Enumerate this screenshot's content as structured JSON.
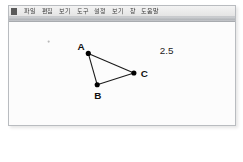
{
  "window": {
    "app_mark_name": "app-icon",
    "menu_items": [
      {
        "label": "파일"
      },
      {
        "label": "편집"
      },
      {
        "label": "보기"
      },
      {
        "label": "도구"
      },
      {
        "label": "설정"
      },
      {
        "label": "보기"
      },
      {
        "label": "창"
      },
      {
        "label": "도움말"
      }
    ]
  },
  "canvas": {
    "background_color": "#fcfcfc",
    "stroke_color": "#1a1a1a",
    "points": [
      {
        "label": "A",
        "x": 80,
        "y": 32,
        "label_dx": -11,
        "label_dy": -3
      },
      {
        "label": "B",
        "x": 89,
        "y": 64,
        "label_dx": -3,
        "label_dy": 14
      },
      {
        "label": "C",
        "x": 126,
        "y": 52,
        "label_dx": 7,
        "label_dy": 4
      }
    ],
    "segments": [
      {
        "from": "A",
        "to": "B"
      },
      {
        "from": "B",
        "to": "C"
      },
      {
        "from": "C",
        "to": "A"
      }
    ],
    "measurement": {
      "value": "2.5",
      "x": 152,
      "y": 33
    },
    "stray_mark": {
      "x": 40,
      "y": 20,
      "r": 1.1
    }
  }
}
